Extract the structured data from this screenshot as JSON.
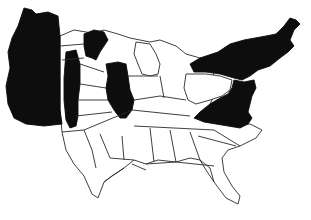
{
  "map": {
    "type": "cartogram",
    "region": "United States (contiguous)",
    "style": "black-and-white",
    "colors": {
      "filled": "#0d0d0d",
      "unfilled": "#ffffff",
      "border": "#2a2a2a"
    },
    "filled_regions": [
      "west-coast",
      "interior-west-strip",
      "upper-midwest",
      "illinois",
      "northeast",
      "mid-atlantic"
    ],
    "unfilled_regions": [
      "mountain-west",
      "plains",
      "texas",
      "south-central",
      "michigan",
      "ohio-valley",
      "southeast",
      "florida"
    ]
  }
}
